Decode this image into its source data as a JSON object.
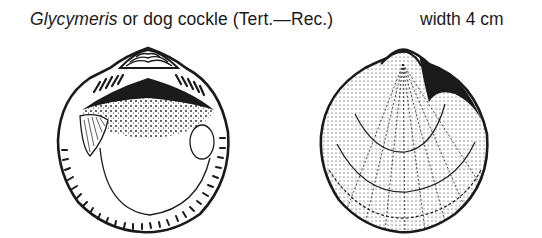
{
  "caption": {
    "genus": "Glycymeris",
    "rest": " or dog cockle (Tert.—Rec.)"
  },
  "size_label": "width 4 cm",
  "figures": [
    {
      "view": "interior",
      "description": "inner surface of valve showing hinge teeth, muscle scars and crenulated margin"
    },
    {
      "view": "exterior",
      "description": "outer surface of valve showing umbo, radial ribs and concentric growth lines"
    }
  ],
  "colors": {
    "ink": "#1a1a1a",
    "paper": "#ffffff"
  }
}
